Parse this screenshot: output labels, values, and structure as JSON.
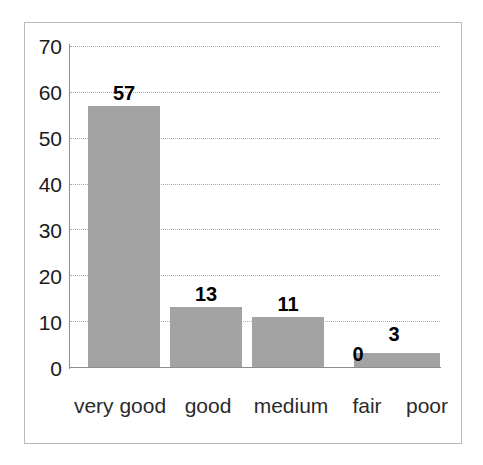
{
  "chart_data": {
    "type": "bar",
    "title": "",
    "subtitle": "",
    "xlabel": "",
    "ylabel": "",
    "categories": [
      "very good",
      "good",
      "medium",
      "fair",
      "poor"
    ],
    "values": [
      57,
      13,
      11,
      0,
      3
    ],
    "data_labels": [
      "57",
      "13",
      "11",
      "0",
      "3"
    ],
    "ylim": [
      0,
      70
    ],
    "y_ticks": [
      70,
      60,
      50,
      40,
      30,
      20,
      10,
      0
    ],
    "y_tick_labels": [
      "70",
      "60",
      "50",
      "40",
      "30",
      "20",
      "10",
      "0"
    ],
    "grid": true,
    "grid_style": "dotted",
    "legend": null,
    "legend_position": "none",
    "bar_color": "#a3a3a3",
    "axis_color": "#8d8d8d",
    "grid_color": "#a9a9c4",
    "text_color": "#1a1a1a",
    "background_color": "#ffffff",
    "frame_color": "#b9b9b9"
  }
}
